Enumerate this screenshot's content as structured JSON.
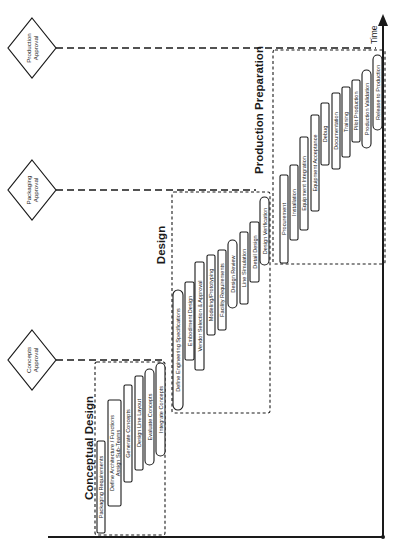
{
  "diagram": {
    "axis_label": "Time",
    "milestones": [
      {
        "id": "production",
        "line1": "Production",
        "line2": "Approval",
        "cx": 32,
        "cy": 48,
        "line_end": 376
      },
      {
        "id": "packaging",
        "line1": "Packaging",
        "line2": "Approval",
        "cx": 32,
        "cy": 190,
        "line_end": 256
      },
      {
        "id": "concepts",
        "line1": "Concepts",
        "line2": "Approval",
        "cx": 32,
        "cy": 360,
        "line_end": 163
      }
    ],
    "phases": [
      {
        "id": "conceptual-design",
        "label": "Conceptual Design",
        "box": {
          "x": 95,
          "y": 362,
          "w": 70,
          "h": 173
        },
        "label_pos": {
          "x": 89,
          "y": 448
        },
        "tasks": [
          {
            "label": "Packaging Requirements",
            "shape": "rect",
            "x": 97,
            "y": 441,
            "w": 8,
            "h": 92
          },
          {
            "label": "Define Architecture / Functions",
            "shape": "rect",
            "x": 108,
            "y": 400,
            "w": 13,
            "h": 106,
            "label2": "Assign Sub-Teams"
          },
          {
            "label": "Generate Concepts",
            "shape": "rect",
            "x": 124,
            "y": 385,
            "w": 8,
            "h": 97
          },
          {
            "label": "Design Line Layout",
            "shape": "rect",
            "x": 135,
            "y": 376,
            "w": 8,
            "h": 94
          },
          {
            "label": "Evaluate Concepts",
            "shape": "oval",
            "x": 145,
            "y": 369,
            "w": 9,
            "h": 96
          },
          {
            "label": "Integrate Concepts",
            "shape": "oval",
            "x": 156,
            "y": 363,
            "w": 9,
            "h": 93
          }
        ]
      },
      {
        "id": "design",
        "label": "Design",
        "box": {
          "x": 172,
          "y": 192,
          "w": 98,
          "h": 221
        },
        "label_pos": {
          "x": 161,
          "y": 245
        },
        "tasks": [
          {
            "label": "Define Engineering Specifications",
            "shape": "oval",
            "x": 173,
            "y": 290,
            "w": 10,
            "h": 120
          },
          {
            "label": "Embodiment Design",
            "shape": "rect",
            "x": 185,
            "y": 282,
            "w": 9,
            "h": 78
          },
          {
            "label": "Vendor Selection & Approval",
            "shape": "rect",
            "x": 195,
            "y": 262,
            "w": 9,
            "h": 108
          },
          {
            "label": "Modeling/Prototyping",
            "shape": "rect",
            "x": 207,
            "y": 255,
            "w": 8,
            "h": 80
          },
          {
            "label": "Facility Requirements",
            "shape": "rect",
            "x": 218,
            "y": 250,
            "w": 8,
            "h": 80
          },
          {
            "label": "Design Review",
            "shape": "oval",
            "x": 228,
            "y": 240,
            "w": 9,
            "h": 68
          },
          {
            "label": "Line Simulation",
            "shape": "rect",
            "x": 240,
            "y": 232,
            "w": 8,
            "h": 72
          },
          {
            "label": "Detail Design",
            "shape": "rect",
            "x": 250,
            "y": 222,
            "w": 9,
            "h": 60
          },
          {
            "label": "Design Verification",
            "shape": "oval",
            "x": 260,
            "y": 197,
            "w": 9,
            "h": 68
          }
        ]
      },
      {
        "id": "production-preparation",
        "label": "Production Preparation",
        "box": {
          "x": 273,
          "y": 50,
          "w": 112,
          "h": 214
        },
        "label_pos": {
          "x": 259,
          "y": 110
        },
        "tasks": [
          {
            "label": "Procurement",
            "shape": "rect",
            "x": 280,
            "y": 175,
            "w": 8,
            "h": 88
          },
          {
            "label": "Installation",
            "shape": "rect",
            "x": 290,
            "y": 165,
            "w": 8,
            "h": 75
          },
          {
            "label": "Equipment Integration",
            "shape": "rect",
            "x": 300,
            "y": 137,
            "w": 8,
            "h": 93
          },
          {
            "label": "Equipment Acceptance",
            "shape": "rect",
            "x": 311,
            "y": 115,
            "w": 8,
            "h": 96
          },
          {
            "label": "Debug",
            "shape": "rect",
            "x": 321,
            "y": 103,
            "w": 8,
            "h": 62
          },
          {
            "label": "Documentation",
            "shape": "rect",
            "x": 332,
            "y": 93,
            "w": 8,
            "h": 76
          },
          {
            "label": "Training",
            "shape": "rect",
            "x": 342,
            "y": 87,
            "w": 8,
            "h": 70
          },
          {
            "label": "Pilot Production",
            "shape": "rect",
            "x": 352,
            "y": 80,
            "w": 8,
            "h": 62
          },
          {
            "label": "Production Validation",
            "shape": "oval",
            "x": 362,
            "y": 70,
            "w": 9,
            "h": 78
          },
          {
            "label": "Release to Production",
            "shape": "oval",
            "x": 373,
            "y": 55,
            "w": 9,
            "h": 75
          }
        ]
      }
    ]
  }
}
